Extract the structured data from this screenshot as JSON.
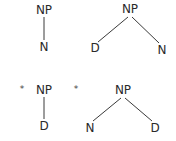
{
  "trees": [
    {
      "id": "tree-1",
      "grammatical": true,
      "marker": "",
      "root": {
        "label": "NP",
        "x": 44,
        "y": 14
      },
      "children": [
        {
          "label": "N",
          "x": 44,
          "y": 51
        }
      ]
    },
    {
      "id": "tree-2",
      "grammatical": true,
      "marker": "",
      "root": {
        "label": "NP",
        "x": 130,
        "y": 13
      },
      "children": [
        {
          "label": "D",
          "x": 95,
          "y": 52
        },
        {
          "label": "N",
          "x": 162,
          "y": 54
        }
      ]
    },
    {
      "id": "tree-3",
      "grammatical": false,
      "marker": "*",
      "marker_pos": {
        "x": 22,
        "y": 92
      },
      "root": {
        "label": "NP",
        "x": 44,
        "y": 94
      },
      "children": [
        {
          "label": "D",
          "x": 44,
          "y": 130
        }
      ]
    },
    {
      "id": "tree-4",
      "grammatical": false,
      "marker": "*",
      "marker_pos": {
        "x": 76,
        "y": 92
      },
      "root": {
        "label": "NP",
        "x": 123,
        "y": 94
      },
      "children": [
        {
          "label": "N",
          "x": 90,
          "y": 132
        },
        {
          "label": "D",
          "x": 155,
          "y": 132
        }
      ]
    }
  ]
}
